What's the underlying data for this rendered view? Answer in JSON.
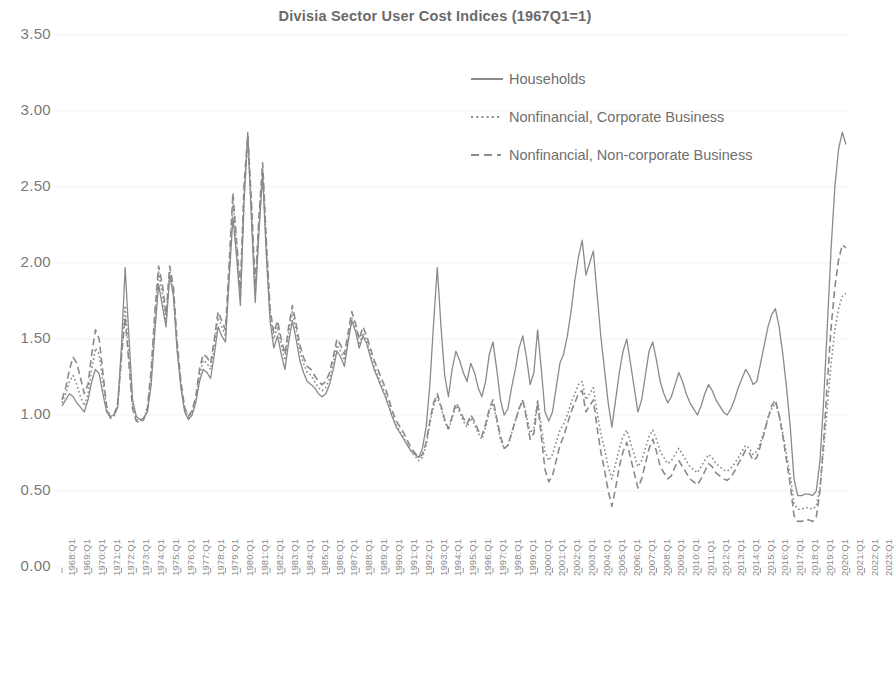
{
  "chart_data": {
    "type": "line",
    "title": "Divisia Sector User Cost Indices (1967Q1=1)",
    "xlabel": "",
    "ylabel": "",
    "ylim": [
      0.0,
      3.5
    ],
    "ytick_values": [
      0.0,
      0.5,
      1.0,
      1.5,
      2.0,
      2.5,
      3.0,
      3.5
    ],
    "ytick_labels": [
      "0.00",
      "0.50",
      "1.00",
      "1.50",
      "2.00",
      "2.50",
      "3.00",
      "3.50"
    ],
    "grid": "faint-horizontal",
    "legend_position": "top-center-right",
    "x_tick_labels": [
      "1968:Q1",
      "1969:Q1",
      "1970:Q1",
      "1971:Q1",
      "1972:Q1",
      "1973:Q1",
      "1974:Q1",
      "1975:Q1",
      "1976:Q1",
      "1977:Q1",
      "1978:Q1",
      "1979:Q1",
      "1980:Q1",
      "1981:Q1",
      "1982:Q1",
      "1983:Q1",
      "1984:Q1",
      "1985:Q1",
      "1986:Q1",
      "1987:Q1",
      "1988:Q1",
      "1989:Q1",
      "1990:Q1",
      "1991:Q1",
      "1992:Q1",
      "1993:Q1",
      "1994:Q1",
      "1995:Q1",
      "1996:Q1",
      "1997:Q1",
      "1998:Q1",
      "1999:Q1",
      "2000:Q1",
      "2001:Q1",
      "2002:Q1",
      "2003:Q1",
      "2004:Q1",
      "2005:Q1",
      "2006:Q1",
      "2007:Q1",
      "2008:Q1",
      "2009:Q1",
      "2010:Q1",
      "2011:Q1",
      "2012:Q1",
      "2013:Q1",
      "2014:Q1",
      "2015:Q1",
      "2016:Q1",
      "2017:Q1",
      "2018:Q1",
      "2019:Q1",
      "2020:Q1",
      "2021:Q1",
      "2022:Q1",
      "2023:Q1"
    ],
    "x_start": "1968:Q1",
    "x_end": "2023:Q4",
    "frequency": "quarterly",
    "colors": {
      "households": "#8a8a8a",
      "corporate": "#8a8a8a",
      "noncorporate": "#8a8a8a"
    },
    "series": [
      {
        "name": "Households",
        "line_style": "solid",
        "values": [
          1.06,
          1.1,
          1.14,
          1.12,
          1.08,
          1.05,
          1.02,
          1.1,
          1.22,
          1.3,
          1.27,
          1.14,
          1.02,
          0.99,
          1.0,
          1.05,
          1.45,
          1.97,
          1.52,
          1.1,
          0.99,
          0.97,
          0.98,
          1.02,
          1.2,
          1.55,
          1.86,
          1.72,
          1.58,
          1.92,
          1.78,
          1.42,
          1.18,
          1.02,
          0.97,
          1.0,
          1.08,
          1.22,
          1.3,
          1.28,
          1.24,
          1.4,
          1.58,
          1.52,
          1.48,
          1.9,
          2.3,
          2.04,
          1.72,
          2.4,
          2.86,
          2.28,
          1.74,
          2.2,
          2.58,
          2.05,
          1.62,
          1.44,
          1.52,
          1.4,
          1.3,
          1.48,
          1.62,
          1.5,
          1.36,
          1.28,
          1.22,
          1.2,
          1.18,
          1.14,
          1.12,
          1.14,
          1.2,
          1.3,
          1.42,
          1.38,
          1.32,
          1.48,
          1.62,
          1.55,
          1.44,
          1.52,
          1.47,
          1.38,
          1.3,
          1.24,
          1.18,
          1.12,
          1.05,
          0.98,
          0.92,
          0.88,
          0.84,
          0.8,
          0.76,
          0.74,
          0.72,
          0.78,
          0.92,
          1.2,
          1.6,
          1.97,
          1.58,
          1.26,
          1.12,
          1.3,
          1.42,
          1.36,
          1.28,
          1.22,
          1.34,
          1.28,
          1.18,
          1.12,
          1.22,
          1.4,
          1.48,
          1.3,
          1.1,
          1.0,
          1.04,
          1.18,
          1.3,
          1.44,
          1.52,
          1.38,
          1.2,
          1.28,
          1.56,
          1.3,
          1.02,
          0.96,
          1.02,
          1.18,
          1.34,
          1.4,
          1.52,
          1.68,
          1.88,
          2.04,
          2.15,
          1.92,
          2.0,
          2.08,
          1.8,
          1.52,
          1.3,
          1.08,
          0.92,
          1.1,
          1.28,
          1.42,
          1.5,
          1.34,
          1.18,
          1.02,
          1.1,
          1.26,
          1.42,
          1.48,
          1.36,
          1.22,
          1.14,
          1.08,
          1.12,
          1.2,
          1.28,
          1.22,
          1.14,
          1.08,
          1.04,
          1.0,
          1.06,
          1.14,
          1.2,
          1.16,
          1.1,
          1.06,
          1.02,
          1.0,
          1.04,
          1.1,
          1.18,
          1.24,
          1.3,
          1.26,
          1.2,
          1.22,
          1.34,
          1.46,
          1.58,
          1.66,
          1.7,
          1.58,
          1.4,
          1.18,
          0.92,
          0.58,
          0.47,
          0.47,
          0.48,
          0.48,
          0.47,
          0.5,
          0.7,
          1.1,
          1.6,
          2.1,
          2.5,
          2.75,
          2.86,
          2.78
        ]
      },
      {
        "name": "Nonfinancial, Corporate Business",
        "line_style": "dotted",
        "values": [
          1.08,
          1.14,
          1.22,
          1.26,
          1.2,
          1.12,
          1.06,
          1.14,
          1.3,
          1.44,
          1.4,
          1.22,
          1.04,
          0.98,
          0.99,
          1.06,
          1.4,
          1.72,
          1.38,
          1.06,
          0.97,
          0.96,
          0.98,
          1.04,
          1.26,
          1.62,
          1.94,
          1.8,
          1.62,
          1.95,
          1.8,
          1.44,
          1.2,
          1.04,
          0.98,
          1.02,
          1.1,
          1.26,
          1.36,
          1.34,
          1.3,
          1.46,
          1.64,
          1.58,
          1.52,
          1.96,
          2.4,
          2.1,
          1.78,
          2.46,
          2.8,
          2.34,
          1.8,
          2.26,
          2.62,
          2.1,
          1.66,
          1.5,
          1.58,
          1.46,
          1.36,
          1.54,
          1.68,
          1.56,
          1.42,
          1.34,
          1.28,
          1.26,
          1.22,
          1.18,
          1.16,
          1.18,
          1.24,
          1.34,
          1.46,
          1.42,
          1.36,
          1.5,
          1.64,
          1.57,
          1.46,
          1.54,
          1.49,
          1.4,
          1.32,
          1.26,
          1.2,
          1.14,
          1.06,
          0.99,
          0.93,
          0.89,
          0.85,
          0.8,
          0.76,
          0.73,
          0.7,
          0.72,
          0.8,
          0.94,
          1.06,
          1.12,
          1.05,
          0.96,
          0.9,
          0.98,
          1.06,
          1.02,
          0.96,
          0.92,
          0.98,
          0.94,
          0.88,
          0.84,
          0.92,
          1.02,
          1.08,
          0.96,
          0.84,
          0.78,
          0.8,
          0.88,
          0.96,
          1.04,
          1.1,
          1.0,
          0.88,
          0.92,
          1.1,
          0.92,
          0.76,
          0.7,
          0.74,
          0.82,
          0.9,
          0.94,
          1.0,
          1.08,
          1.14,
          1.2,
          1.22,
          1.1,
          1.14,
          1.18,
          1.02,
          0.88,
          0.78,
          0.66,
          0.58,
          0.68,
          0.78,
          0.86,
          0.9,
          0.82,
          0.74,
          0.66,
          0.7,
          0.78,
          0.86,
          0.9,
          0.84,
          0.76,
          0.72,
          0.68,
          0.7,
          0.74,
          0.78,
          0.74,
          0.7,
          0.66,
          0.64,
          0.62,
          0.66,
          0.7,
          0.74,
          0.72,
          0.68,
          0.66,
          0.64,
          0.63,
          0.65,
          0.68,
          0.72,
          0.76,
          0.8,
          0.78,
          0.74,
          0.76,
          0.82,
          0.9,
          0.98,
          1.04,
          1.08,
          1.0,
          0.88,
          0.74,
          0.6,
          0.42,
          0.38,
          0.38,
          0.39,
          0.39,
          0.38,
          0.4,
          0.52,
          0.78,
          1.06,
          1.34,
          1.56,
          1.7,
          1.78,
          1.8
        ]
      },
      {
        "name": "Nonfinancial, Non-corporate Business",
        "line_style": "dashed",
        "values": [
          1.1,
          1.18,
          1.3,
          1.38,
          1.34,
          1.24,
          1.14,
          1.2,
          1.4,
          1.56,
          1.5,
          1.28,
          1.06,
          0.98,
          1.0,
          1.08,
          1.38,
          1.64,
          1.34,
          1.04,
          0.96,
          0.95,
          0.97,
          1.05,
          1.3,
          1.68,
          1.98,
          1.86,
          1.66,
          1.98,
          1.84,
          1.48,
          1.22,
          1.05,
          0.99,
          1.03,
          1.12,
          1.3,
          1.4,
          1.38,
          1.34,
          1.5,
          1.68,
          1.62,
          1.56,
          2.0,
          2.46,
          2.14,
          1.82,
          2.52,
          2.84,
          2.4,
          1.84,
          2.3,
          2.66,
          2.14,
          1.7,
          1.54,
          1.62,
          1.5,
          1.4,
          1.58,
          1.72,
          1.6,
          1.46,
          1.38,
          1.32,
          1.3,
          1.26,
          1.22,
          1.2,
          1.22,
          1.28,
          1.38,
          1.5,
          1.46,
          1.4,
          1.54,
          1.68,
          1.6,
          1.5,
          1.58,
          1.52,
          1.44,
          1.36,
          1.3,
          1.24,
          1.18,
          1.1,
          1.02,
          0.96,
          0.92,
          0.88,
          0.83,
          0.78,
          0.75,
          0.72,
          0.74,
          0.82,
          0.96,
          1.08,
          1.14,
          1.06,
          0.97,
          0.91,
          0.99,
          1.08,
          1.04,
          0.98,
          0.94,
          1.0,
          0.96,
          0.9,
          0.86,
          0.94,
          1.04,
          1.1,
          0.98,
          0.86,
          0.78,
          0.8,
          0.88,
          0.96,
          1.04,
          1.1,
          0.98,
          0.84,
          0.88,
          1.08,
          0.86,
          0.64,
          0.56,
          0.6,
          0.7,
          0.8,
          0.86,
          0.94,
          1.02,
          1.08,
          1.14,
          1.16,
          1.02,
          1.06,
          1.1,
          0.92,
          0.76,
          0.64,
          0.5,
          0.4,
          0.52,
          0.66,
          0.76,
          0.82,
          0.72,
          0.62,
          0.52,
          0.58,
          0.68,
          0.78,
          0.84,
          0.76,
          0.66,
          0.62,
          0.58,
          0.6,
          0.66,
          0.7,
          0.66,
          0.62,
          0.58,
          0.56,
          0.54,
          0.58,
          0.63,
          0.68,
          0.66,
          0.62,
          0.6,
          0.58,
          0.57,
          0.59,
          0.63,
          0.68,
          0.72,
          0.77,
          0.75,
          0.7,
          0.72,
          0.8,
          0.88,
          0.98,
          1.06,
          1.1,
          1.0,
          0.86,
          0.7,
          0.54,
          0.34,
          0.3,
          0.3,
          0.31,
          0.31,
          0.3,
          0.33,
          0.5,
          0.84,
          1.22,
          1.58,
          1.84,
          2.02,
          2.12,
          2.1
        ]
      }
    ]
  },
  "legend": {
    "items": [
      {
        "label": "Households",
        "style": "solid"
      },
      {
        "label": "Nonfinancial, Corporate Business",
        "style": "dotted"
      },
      {
        "label": "Nonfinancial, Non-corporate Business",
        "style": "dashed"
      }
    ]
  }
}
